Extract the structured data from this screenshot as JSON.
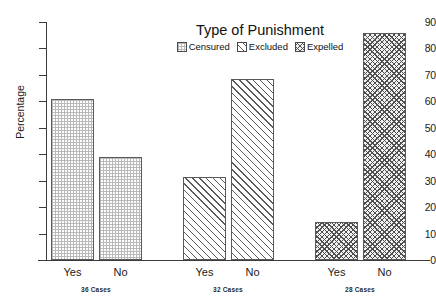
{
  "chart_data": {
    "type": "bar",
    "title": "Type of Punishment",
    "xlabel": "",
    "ylabel": "Percentage",
    "ylim": [
      0,
      90
    ],
    "ytick_step": 10,
    "yticks": [
      0,
      10,
      20,
      30,
      40,
      50,
      60,
      70,
      80,
      90
    ],
    "grid": false,
    "legend_position": "top-center",
    "categories": [
      "Yes",
      "No"
    ],
    "series": [
      {
        "name": "Censured",
        "values": [
          61,
          39
        ],
        "pattern": "dots",
        "group_label": "36 Cases"
      },
      {
        "name": "Excluded",
        "values": [
          31.5,
          68.5
        ],
        "pattern": "diagonal",
        "group_label": "32 Cases"
      },
      {
        "name": "Expelled",
        "values": [
          14.5,
          86
        ],
        "pattern": "crosshatch",
        "group_label": "28 Cases"
      }
    ]
  },
  "axis": {
    "y_title": "Percentage",
    "y_tick_labels": [
      "90",
      "80",
      "70",
      "60",
      "50",
      "40",
      "30",
      "20",
      "10",
      "0"
    ]
  },
  "title": {
    "text": "Type of Punishment"
  },
  "legend": {
    "items": [
      {
        "label": "Censured",
        "icon": "legend-swatch-dotted"
      },
      {
        "label": "Excluded",
        "icon": "legend-swatch-diagonal"
      },
      {
        "label": "Expelled",
        "icon": "legend-swatch-crosshatch"
      }
    ]
  },
  "groups": [
    {
      "series": "Censured",
      "cases_label": "36 Cases",
      "bars": [
        {
          "category": "Yes",
          "value": 61
        },
        {
          "category": "No",
          "value": 39
        }
      ]
    },
    {
      "series": "Excluded",
      "cases_label": "32 Cases",
      "bars": [
        {
          "category": "Yes",
          "value": 31.5
        },
        {
          "category": "No",
          "value": 68.5
        }
      ]
    },
    {
      "series": "Expelled",
      "cases_label": "28 Cases",
      "bars": [
        {
          "category": "Yes",
          "value": 14.5
        },
        {
          "category": "No",
          "value": 86
        }
      ]
    }
  ],
  "colors": {
    "axis": "#3b3b3b",
    "bar_outline": "#5a5a5a",
    "pattern": "#585858",
    "background": "#ffffff",
    "text": "#1a1a1a"
  }
}
